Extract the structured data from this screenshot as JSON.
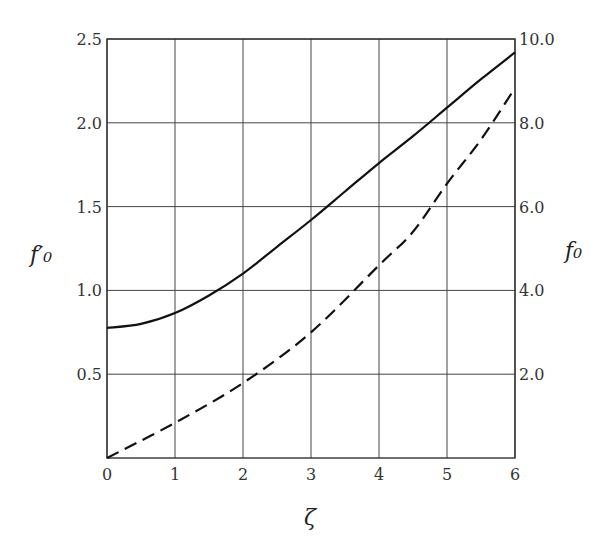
{
  "chart_data": {
    "type": "line",
    "title": "",
    "xlabel": "ζ",
    "ylabel_left": "f′₀",
    "ylabel_right": "f₀",
    "xlim": [
      0,
      6
    ],
    "ylim_left": [
      0,
      2.5
    ],
    "ylim_right": [
      0,
      10.0
    ],
    "grid": true,
    "x_ticks": [
      "0",
      "1",
      "2",
      "3",
      "4",
      "5",
      "6"
    ],
    "y_ticks_left": [
      "0.5",
      "1.0",
      "1.5",
      "2.0",
      "2.5"
    ],
    "y_ticks_right": [
      "2.0",
      "4.0",
      "6.0",
      "8.0",
      "10.0"
    ],
    "series": [
      {
        "name": "f′₀",
        "axis": "left",
        "style": "solid",
        "x": [
          0,
          0.5,
          1,
          1.5,
          2,
          2.5,
          3,
          3.5,
          4,
          4.5,
          5,
          5.5,
          6
        ],
        "values": [
          0.776,
          0.8,
          0.865,
          0.97,
          1.1,
          1.26,
          1.42,
          1.59,
          1.76,
          1.92,
          2.09,
          2.26,
          2.42
        ]
      },
      {
        "name": "f₀",
        "axis": "right",
        "style": "dashed",
        "x": [
          0,
          1,
          2,
          3,
          4,
          4.5,
          5,
          5.5,
          6
        ],
        "values": [
          0,
          0.84,
          1.79,
          3.0,
          4.6,
          5.4,
          6.55,
          7.6,
          8.83
        ]
      }
    ]
  }
}
